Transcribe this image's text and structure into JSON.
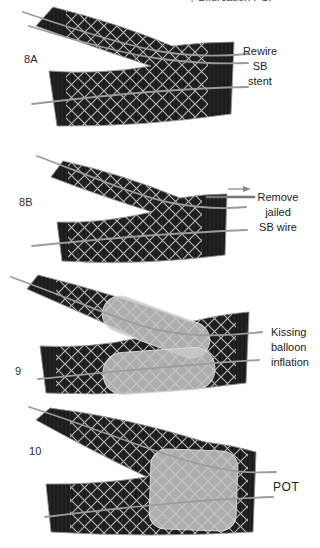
{
  "header": {
    "cropped_text": "† Bifurcation PCI"
  },
  "figure": {
    "panels": [
      {
        "label": "8A",
        "annotation": {
          "lines": [
            "Rewire",
            "SB",
            "stent"
          ]
        }
      },
      {
        "label": "8B",
        "annotation": {
          "lines": [
            "Remove",
            "jailed",
            "SB wire"
          ]
        }
      },
      {
        "label": "9",
        "annotation": {
          "lines": [
            "Kissing",
            "balloon",
            "inflation"
          ]
        }
      },
      {
        "label": "10",
        "annotation": {
          "lines": [
            "POT"
          ]
        }
      }
    ],
    "icons": [
      {
        "name": "right-arrow-icon"
      }
    ],
    "colors": {
      "background": "#ffffff",
      "vessel_wall": "#1a1a1a",
      "stent_mesh": "#b3b3b3",
      "guidewire": "#9b9b9b",
      "balloon": "#c8c8c8",
      "text": "#1c1c1c"
    }
  }
}
